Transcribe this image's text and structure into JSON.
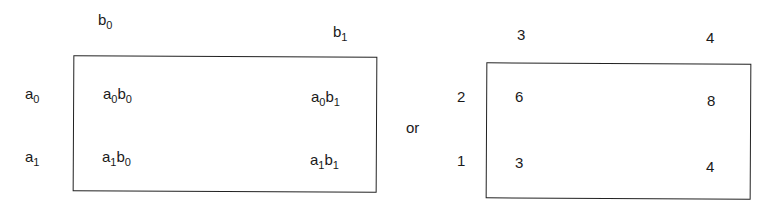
{
  "symbolic_table": {
    "col_headers": [
      {
        "base": "b",
        "sub": "0"
      },
      {
        "base": "b",
        "sub": "1"
      }
    ],
    "row_headers": [
      {
        "base": "a",
        "sub": "0"
      },
      {
        "base": "a",
        "sub": "1"
      }
    ],
    "cells": [
      [
        {
          "a": "a",
          "a_sub": "0",
          "b": "b",
          "b_sub": "0"
        },
        {
          "a": "a",
          "a_sub": "0",
          "b": "b",
          "b_sub": "1"
        }
      ],
      [
        {
          "a": "a",
          "a_sub": "1",
          "b": "b",
          "b_sub": "0"
        },
        {
          "a": "a",
          "a_sub": "1",
          "b": "b",
          "b_sub": "1"
        }
      ]
    ]
  },
  "connector": "or",
  "numeric_table": {
    "col_headers": [
      "3",
      "4"
    ],
    "row_headers": [
      "2",
      "1"
    ],
    "cells": [
      [
        "6",
        "8"
      ],
      [
        "3",
        "4"
      ]
    ]
  }
}
